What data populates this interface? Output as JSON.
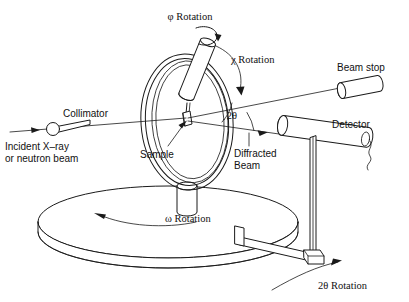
{
  "figure": {
    "background_color": "#ffffff",
    "ink_color": "#1a1a1a",
    "width": 409,
    "height": 302
  },
  "labels": {
    "phi_rotation": "φ Rotation",
    "chi_rotation": "χ Rotation",
    "omega_rotation": "ω Rotation",
    "two_theta_rotation": "2θ Rotation",
    "two_theta_angle": "2θ",
    "beam_stop": "Beam stop",
    "detector": "Detector",
    "collimator": "Collimator",
    "incident_beam_line1": "Incident X–ray",
    "incident_beam_line2": "or neutron beam",
    "sample": "Sample",
    "diffracted_beam_line1": "Diffracted",
    "diffracted_beam_line2": "Beam"
  },
  "components": {
    "chi_circle": "chi-circle-ring",
    "phi_head": "phi-goniometer-head",
    "sample_block": "sample-crystal",
    "omega_table": "omega-rotation-table",
    "pedestal": "chi-circle-pedestal",
    "detector_tube": "detector-tube",
    "detector_post": "detector-vertical-post",
    "detector_arm": "two-theta-arm",
    "beam_stop_tube": "beam-stop-cylinder",
    "collimator_tube": "collimator-cone",
    "detector_cable": "detector-cable"
  }
}
